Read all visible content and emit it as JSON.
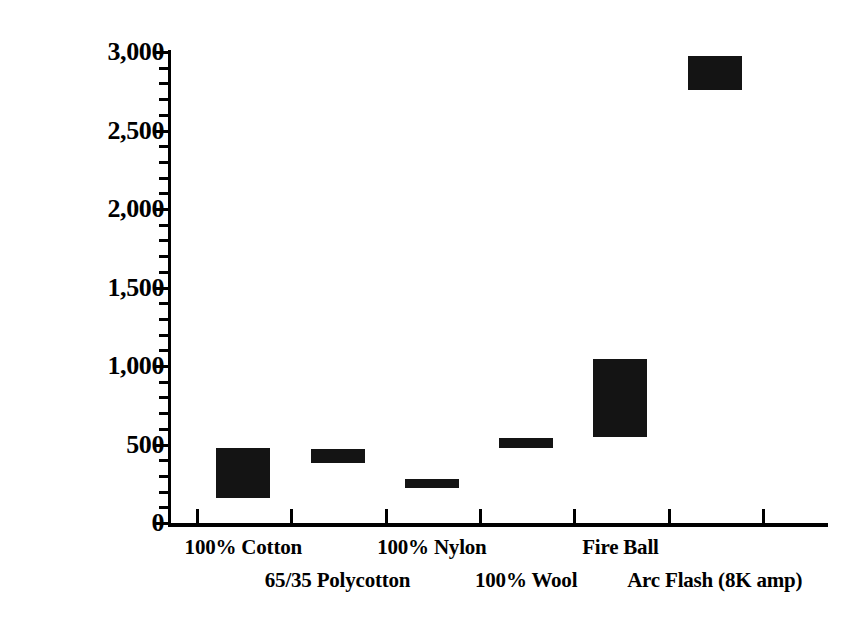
{
  "chart_data": {
    "type": "bar",
    "subtype": "floating-range-bar",
    "title": "",
    "xlabel": "",
    "ylabel": "Degrees Centigrade",
    "ylim": [
      0,
      3000
    ],
    "y_major_ticks": [
      0,
      500,
      1000,
      1500,
      2000,
      2500,
      3000
    ],
    "y_tick_labels": [
      "0",
      "500",
      "1,000",
      "1,500",
      "2,000",
      "2,500",
      "3,000"
    ],
    "y_minor_tick_interval": 100,
    "grid": false,
    "legend": false,
    "bar_color": "#141414",
    "categories": [
      "100% Cotton",
      "65/35 Polycotton",
      "100% Nylon",
      "100% Wool",
      "Fire Ball",
      "Arc Flash (8K amp)"
    ],
    "values": [
      {
        "category": "100% Cotton",
        "low": 160,
        "high": 480
      },
      {
        "category": "65/35 Polycotton",
        "low": 385,
        "high": 470
      },
      {
        "category": "100% Nylon",
        "low": 225,
        "high": 280
      },
      {
        "category": "100% Wool",
        "low": 475,
        "high": 540
      },
      {
        "category": "Fire Ball",
        "low": 545,
        "high": 1045
      },
      {
        "category": "Arc Flash (8K amp)",
        "low": 2760,
        "high": 2975
      }
    ]
  },
  "axis": {
    "y_title": "Degrees Centigrade",
    "y_ticks": [
      {
        "label": "3,000",
        "value": 3000
      },
      {
        "label": "2,500",
        "value": 2500
      },
      {
        "label": "2,000",
        "value": 2000
      },
      {
        "label": "1,500",
        "value": 1500
      },
      {
        "label": "1,000",
        "value": 1000
      },
      {
        "label": "500",
        "value": 500
      },
      {
        "label": "0",
        "value": 0
      }
    ]
  },
  "x_labels": [
    {
      "text": "100% Cotton",
      "row": "a"
    },
    {
      "text": "65/35 Polycotton",
      "row": "b"
    },
    {
      "text": "100% Nylon",
      "row": "a"
    },
    {
      "text": "100% Wool",
      "row": "b"
    },
    {
      "text": "Fire Ball",
      "row": "a"
    },
    {
      "text": "Arc Flash (8K amp)",
      "row": "b"
    }
  ]
}
